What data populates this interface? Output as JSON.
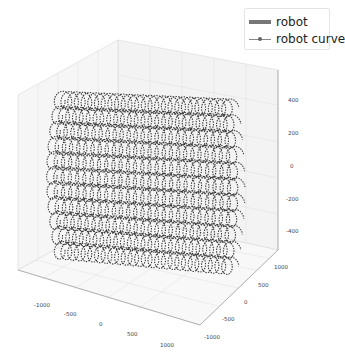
{
  "chart_data": {
    "type": "scatter3d",
    "title": "",
    "xlabel": "",
    "ylabel": "",
    "zlabel": "",
    "x_ticks": [
      "-1000",
      "-500",
      "0",
      "500",
      "1000"
    ],
    "y_ticks": [
      "-1000",
      "-500",
      "0",
      "500",
      "1000"
    ],
    "z_ticks": [
      "400",
      "200",
      "0",
      "-200",
      "-400"
    ],
    "xlim": [
      -1200,
      1200
    ],
    "ylim": [
      -1200,
      1200
    ],
    "zlim": [
      -550,
      550
    ],
    "grid": true,
    "legend_position": "upper right",
    "series": [
      {
        "name": "robot",
        "style": "thick line",
        "color": "#666666"
      },
      {
        "name": "robot curve",
        "style": "thin line with dot markers",
        "color": "#555555"
      }
    ]
  },
  "legend": {
    "items": [
      {
        "label": "robot"
      },
      {
        "label": "robot curve"
      }
    ]
  },
  "colors": {
    "curve": "#3a3a3a",
    "pane": "#f4f4f4",
    "grid": "#dcdcdc",
    "axis": "#888888"
  }
}
